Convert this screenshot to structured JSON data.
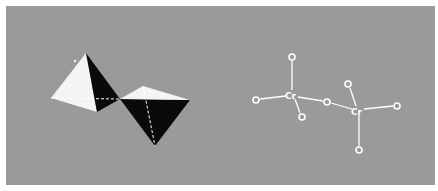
{
  "figure": {
    "background_color": "#9a9a9a",
    "page_color": "#ffffff",
    "panel_left": {
      "description": "Two corner-sharing tetrahedra (polyhedral model)",
      "face_colors": {
        "light": "#f4f4f4",
        "dark": "#0a0a0a"
      }
    },
    "panel_right": {
      "description": "Ball-and-stick schematic of dichromate ion",
      "atoms": [
        {
          "id": "O1",
          "label": "O",
          "x": 292,
          "y": 57
        },
        {
          "id": "O2",
          "label": "O",
          "x": 256,
          "y": 100
        },
        {
          "id": "Cr1",
          "label": "Cr",
          "x": 292,
          "y": 95
        },
        {
          "id": "O3",
          "label": "O",
          "x": 302,
          "y": 117
        },
        {
          "id": "O4",
          "label": "O",
          "x": 327,
          "y": 102
        },
        {
          "id": "O5",
          "label": "O",
          "x": 348,
          "y": 84
        },
        {
          "id": "Cr2",
          "label": "Cr",
          "x": 358,
          "y": 111
        },
        {
          "id": "O6",
          "label": "O",
          "x": 397,
          "y": 106
        },
        {
          "id": "O7",
          "label": "O",
          "x": 359,
          "y": 150
        }
      ],
      "bonds": [
        [
          "Cr1",
          "O1"
        ],
        [
          "Cr1",
          "O2"
        ],
        [
          "Cr1",
          "O3"
        ],
        [
          "Cr1",
          "O4"
        ],
        [
          "Cr2",
          "O4"
        ],
        [
          "Cr2",
          "O5"
        ],
        [
          "Cr2",
          "O6"
        ],
        [
          "Cr2",
          "O7"
        ]
      ],
      "labels": {
        "cr": "Cr",
        "o": "O"
      }
    }
  }
}
